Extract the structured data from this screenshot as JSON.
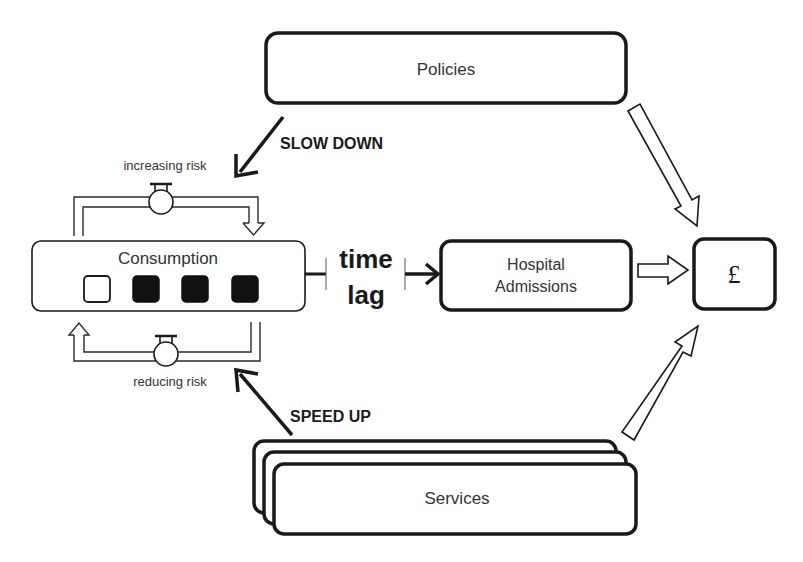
{
  "nodes": {
    "policies": {
      "label": "Policies"
    },
    "consumption": {
      "label": "Consumption",
      "indicators": [
        {
          "state": "empty"
        },
        {
          "state": "filled"
        },
        {
          "state": "filled"
        },
        {
          "state": "filled"
        }
      ]
    },
    "hospital": {
      "line1": "Hospital",
      "line2": "Admissions"
    },
    "cost": {
      "label": "£"
    },
    "services": {
      "label": "Services"
    }
  },
  "flows": {
    "increasing_risk": "increasing risk",
    "reducing_risk": "reducing risk"
  },
  "edges": {
    "slow_down": "SLOW DOWN",
    "speed_up": "SPEED UP",
    "time_lag_line1": "time",
    "time_lag_line2": "lag"
  },
  "colors": {
    "stroke": "#1a1a1a",
    "text": "#333333",
    "fill_filled": "#111111"
  }
}
